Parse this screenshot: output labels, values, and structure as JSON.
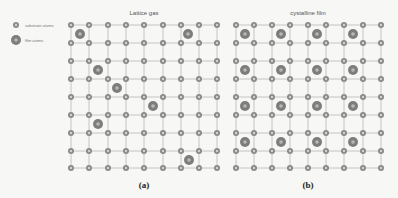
{
  "legend": {
    "items": [
      {
        "label": "substrate atoms",
        "type": "substrate"
      },
      {
        "label": "film atoms",
        "type": "film"
      }
    ]
  },
  "colors": {
    "background": "#f7f7f5",
    "grid_line": "#c4c4c4",
    "substrate_ring": "#8a8a8a",
    "substrate_center": "#d0d0d0",
    "film_outer": "#7d7d7d",
    "film_center": "#b8b8b8"
  },
  "panels": [
    {
      "id": "a",
      "title": "Lattice gas",
      "label": "(a)",
      "grid": {
        "cols": [
          71,
          89,
          108,
          126,
          144,
          163,
          181,
          199,
          217
        ],
        "rows": [
          25,
          43,
          61,
          79,
          97,
          115,
          133,
          151,
          168
        ]
      },
      "film_atoms": [
        [
          80,
          34
        ],
        [
          188,
          34
        ],
        [
          98,
          70
        ],
        [
          117,
          88
        ],
        [
          153,
          106
        ],
        [
          98,
          124
        ],
        [
          189,
          160
        ]
      ]
    },
    {
      "id": "b",
      "title": "cystalline film",
      "label": "(b)",
      "grid": {
        "cols": [
          236,
          254,
          272,
          290,
          308,
          326,
          344,
          363,
          381
        ],
        "rows": [
          25,
          43,
          61,
          79,
          97,
          115,
          133,
          151,
          168
        ]
      },
      "film_atoms": [
        [
          245,
          34
        ],
        [
          281,
          34
        ],
        [
          317,
          34
        ],
        [
          353,
          34
        ],
        [
          245,
          70
        ],
        [
          281,
          70
        ],
        [
          317,
          70
        ],
        [
          353,
          70
        ],
        [
          245,
          106
        ],
        [
          281,
          106
        ],
        [
          317,
          106
        ],
        [
          353,
          106
        ],
        [
          245,
          142
        ],
        [
          281,
          142
        ],
        [
          317,
          142
        ],
        [
          353,
          142
        ]
      ]
    }
  ]
}
